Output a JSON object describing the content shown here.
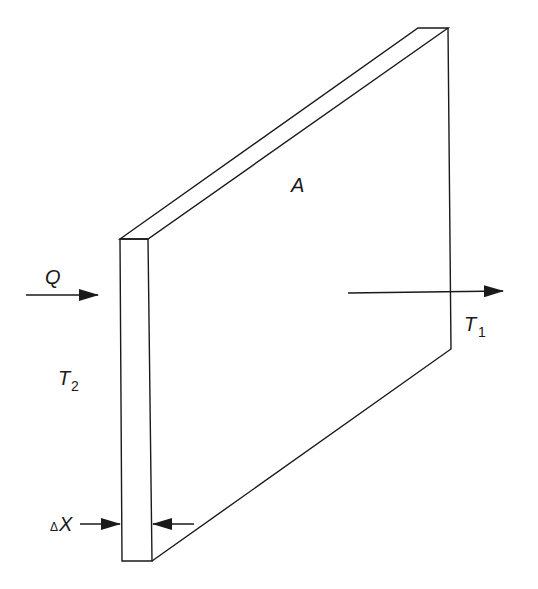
{
  "diagram": {
    "labels": {
      "area": "A",
      "heat_flow": "Q",
      "temp_cold": "T",
      "temp_cold_sub": "1",
      "temp_hot": "T",
      "temp_hot_sub": "2",
      "thickness_delta": "Δ",
      "thickness_var": "X"
    },
    "colors": {
      "stroke": "#1a1a1a",
      "background": "#ffffff"
    }
  }
}
